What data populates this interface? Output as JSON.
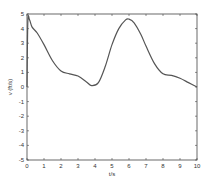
{
  "chart_data": {
    "type": "line",
    "title": "",
    "xlabel": "t/s",
    "ylabel": "v (ft/s)",
    "xlim": [
      0,
      10
    ],
    "ylim": [
      -5,
      5
    ],
    "xticks": [
      "0",
      "1",
      "2",
      "3",
      "4",
      "5",
      "6",
      "7",
      "8",
      "9",
      "10"
    ],
    "yticks": [
      "-5",
      "-4",
      "-3",
      "-2",
      "-1",
      "0",
      "1",
      "2",
      "3",
      "4",
      "5"
    ],
    "grid": false,
    "legend": null,
    "series": [
      {
        "name": "v",
        "color": "#555555",
        "x": [
          0,
          0.05,
          0.15,
          0.3,
          0.6,
          1.0,
          1.5,
          2.0,
          2.5,
          3.0,
          3.5,
          3.8,
          4.2,
          4.6,
          5.0,
          5.4,
          5.8,
          6.0,
          6.3,
          6.7,
          7.0,
          7.5,
          8.0,
          8.5,
          9.0,
          9.5,
          10.0
        ],
        "y": [
          0.0,
          4.5,
          4.6,
          4.1,
          3.7,
          2.9,
          1.8,
          1.1,
          0.9,
          0.75,
          0.35,
          0.1,
          0.3,
          1.4,
          2.9,
          4.0,
          4.6,
          4.65,
          4.4,
          3.6,
          2.8,
          1.6,
          0.9,
          0.8,
          0.6,
          0.3,
          0.0
        ]
      }
    ]
  }
}
